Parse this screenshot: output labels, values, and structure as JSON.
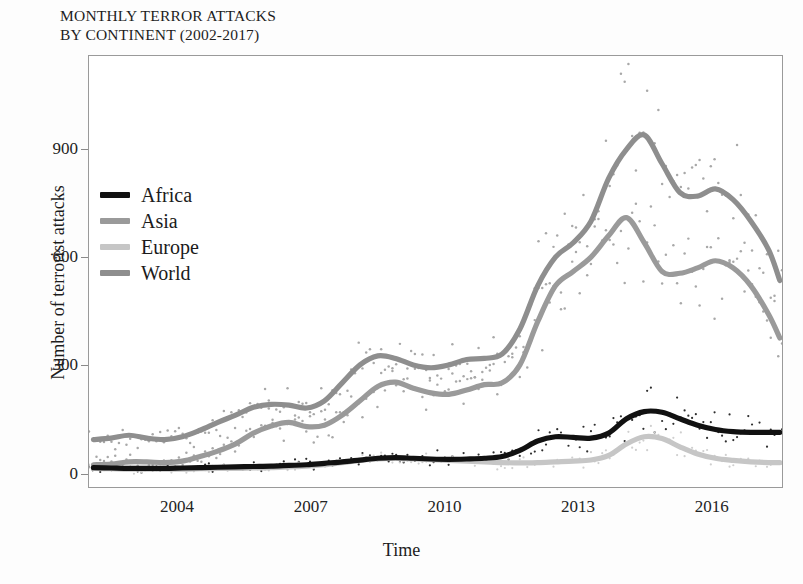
{
  "chart_data": {
    "type": "line",
    "title": "MONTHLY TERROR ATTACKS\nBY CONTINENT (2002-2017)",
    "xlabel": "Time",
    "ylabel": "Number of terrorist attacks",
    "xlim": [
      2002.0,
      2017.6
    ],
    "ylim": [
      -40,
      1160
    ],
    "yticks": [
      0,
      300,
      600,
      900
    ],
    "ytick_labels": [
      "0",
      "300",
      "600",
      "900"
    ],
    "xticks": [
      2004,
      2007,
      2010,
      2013,
      2016
    ],
    "xtick_labels": [
      "2004",
      "2007",
      "2010",
      "2013",
      "2016"
    ],
    "grid": false,
    "legend_position": "upper-left-inside",
    "note": "Thick smoothed trend lines drawn over dotted raw monthly counts",
    "x": [
      2002.1,
      2002.5,
      2002.9,
      2003.3,
      2003.7,
      2004.1,
      2004.5,
      2004.9,
      2005.3,
      2005.7,
      2006.1,
      2006.5,
      2006.9,
      2007.3,
      2007.7,
      2008.1,
      2008.5,
      2008.9,
      2009.3,
      2009.7,
      2010.1,
      2010.5,
      2010.9,
      2011.3,
      2011.7,
      2012.1,
      2012.5,
      2012.9,
      2013.3,
      2013.7,
      2014.1,
      2014.5,
      2014.9,
      2015.3,
      2015.7,
      2016.1,
      2016.5,
      2016.9,
      2017.3,
      2017.55
    ],
    "series": [
      {
        "name": "Africa",
        "color": "#111111",
        "values": [
          14,
          13,
          12,
          12,
          12,
          13,
          14,
          15,
          16,
          17,
          18,
          20,
          22,
          26,
          30,
          35,
          40,
          42,
          40,
          38,
          37,
          38,
          40,
          45,
          62,
          88,
          100,
          98,
          96,
          110,
          150,
          170,
          168,
          150,
          132,
          120,
          114,
          112,
          112,
          112
        ]
      },
      {
        "name": "Asia",
        "color": "#9a9a9a",
        "values": [
          22,
          24,
          30,
          30,
          28,
          32,
          45,
          60,
          80,
          110,
          130,
          140,
          128,
          132,
          160,
          200,
          240,
          252,
          235,
          222,
          218,
          230,
          245,
          250,
          300,
          420,
          520,
          560,
          600,
          660,
          710,
          640,
          560,
          555,
          570,
          590,
          570,
          520,
          440,
          375
        ]
      },
      {
        "name": "Europe",
        "color": "#c6c6c6",
        "values": [
          12,
          11,
          10,
          10,
          10,
          10,
          11,
          12,
          12,
          13,
          14,
          16,
          18,
          22,
          28,
          34,
          38,
          40,
          38,
          36,
          34,
          32,
          30,
          28,
          27,
          28,
          30,
          32,
          35,
          48,
          80,
          100,
          95,
          72,
          52,
          40,
          34,
          30,
          28,
          28
        ]
      },
      {
        "name": "World",
        "color": "#8e8e8e",
        "values": [
          92,
          96,
          104,
          96,
          92,
          100,
          118,
          140,
          160,
          182,
          190,
          188,
          180,
          200,
          250,
          300,
          325,
          318,
          300,
          292,
          300,
          315,
          318,
          330,
          400,
          520,
          600,
          640,
          700,
          820,
          900,
          940,
          860,
          780,
          770,
          790,
          760,
          700,
          620,
          535
        ]
      }
    ],
    "raw_scatter_max": 1100,
    "raw_scatter_note": "dotted vertical scatter of monthly values around each trend line"
  },
  "legend": {
    "items": [
      {
        "label": "Africa",
        "color": "#111111"
      },
      {
        "label": "Asia",
        "color": "#9a9a9a"
      },
      {
        "label": "Europe",
        "color": "#c6c6c6"
      },
      {
        "label": "World",
        "color": "#8e8e8e"
      }
    ]
  }
}
